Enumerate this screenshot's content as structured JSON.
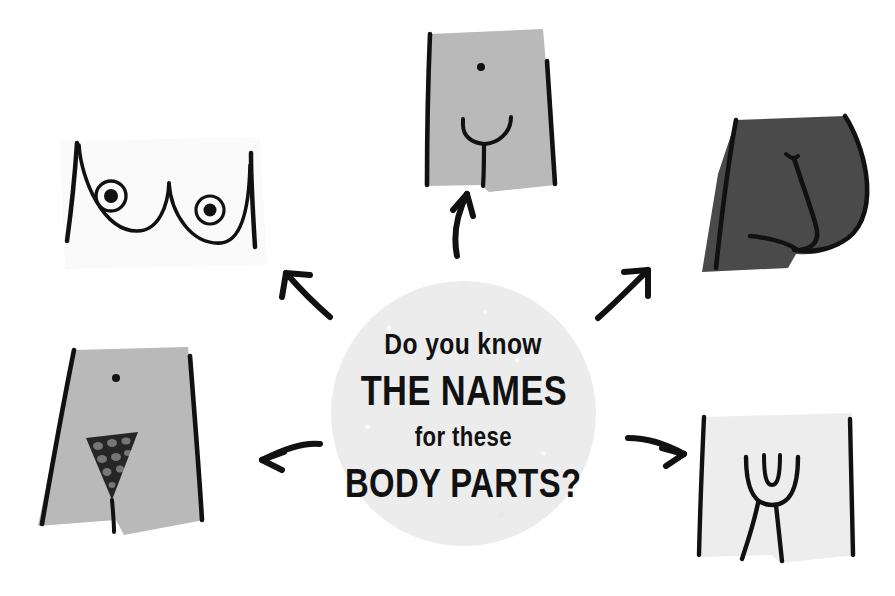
{
  "page": {
    "background_color": "#ffffff",
    "width": 895,
    "height": 596
  },
  "center_badge": {
    "shape": "circle",
    "fill_color": "#ececec",
    "text_color": "#111111",
    "line1": "Do you know",
    "line2": "THE NAMES",
    "line3": "for these",
    "line4": "BODY PARTS?",
    "full_text": "Do you know THE NAMES for these BODY PARTS?"
  },
  "illustrations": [
    {
      "id": "breasts",
      "position": "top-left",
      "label": "breasts-illustration",
      "fill_color": "#fafafa",
      "line_color": "#111111",
      "description": "Chest with two breasts and nipples, outlined"
    },
    {
      "id": "penis-torso",
      "position": "top-center",
      "label": "male-pelvis-illustration",
      "fill_color": "#b9b9b9",
      "line_color": "#111111",
      "description": "Torso with navel and Y-shaped genital line"
    },
    {
      "id": "buttocks",
      "position": "top-right",
      "label": "buttocks-illustration",
      "fill_color": "#4a4a4a",
      "line_color": "#111111",
      "description": "Dark silhouette of buttocks with cleft"
    },
    {
      "id": "pubic-hair-pelvis",
      "position": "bottom-left",
      "label": "pelvis-with-pubic-hair-illustration",
      "fill_color": "#b9b9b9",
      "line_color": "#111111",
      "description": "Hips with navel and scribbled triangular pubic hair"
    },
    {
      "id": "vulva",
      "position": "bottom-right",
      "label": "vulva-illustration",
      "fill_color": "#ededed",
      "line_color": "#111111",
      "description": "Panel with vulva line drawing and legs"
    }
  ],
  "arrows": [
    {
      "id": "arrow-to-breasts",
      "direction": "up-left",
      "color": "#111111"
    },
    {
      "id": "arrow-to-penis-torso",
      "direction": "up",
      "color": "#111111"
    },
    {
      "id": "arrow-to-buttocks",
      "direction": "up-right",
      "color": "#111111"
    },
    {
      "id": "arrow-to-pubic-hair-pelvis",
      "direction": "left",
      "color": "#111111"
    },
    {
      "id": "arrow-to-vulva",
      "direction": "right",
      "color": "#111111"
    }
  ]
}
